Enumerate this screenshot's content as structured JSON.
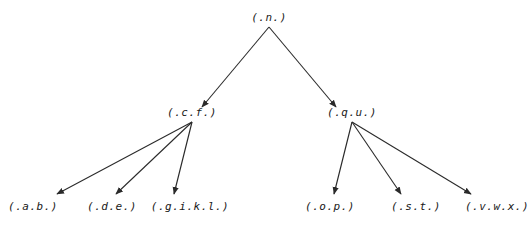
{
  "diagram": {
    "type": "tree",
    "root": {
      "label": "(.n.)",
      "x": 269,
      "y": 18,
      "children": [
        "cf",
        "qu"
      ]
    },
    "nodes": {
      "n": {
        "label": "(.n.)",
        "x": 269,
        "y": 18
      },
      "cf": {
        "label": "(.c.f.)",
        "x": 192,
        "y": 113
      },
      "qu": {
        "label": "(.q.u.)",
        "x": 352,
        "y": 113
      },
      "ab": {
        "label": "(.a.b.)",
        "x": 33,
        "y": 207
      },
      "de": {
        "label": "(.d.e.)",
        "x": 112,
        "y": 207
      },
      "gikl": {
        "label": "(.g.i.k.l.)",
        "x": 190,
        "y": 207
      },
      "op": {
        "label": "(.o.p.)",
        "x": 330,
        "y": 207
      },
      "st": {
        "label": "(.s.t.)",
        "x": 416,
        "y": 207
      },
      "vwx": {
        "label": "(.v.w.x.)",
        "x": 497,
        "y": 207
      }
    },
    "edges": [
      {
        "from": "n",
        "to": "cf",
        "x1": 269,
        "y1": 27,
        "x2": 202,
        "y2": 107
      },
      {
        "from": "n",
        "to": "qu",
        "x1": 269,
        "y1": 27,
        "x2": 336,
        "y2": 107
      },
      {
        "from": "cf",
        "to": "ab",
        "x1": 192,
        "y1": 122,
        "x2": 57,
        "y2": 194
      },
      {
        "from": "cf",
        "to": "de",
        "x1": 192,
        "y1": 122,
        "x2": 116,
        "y2": 194
      },
      {
        "from": "cf",
        "to": "gikl",
        "x1": 192,
        "y1": 122,
        "x2": 174,
        "y2": 194
      },
      {
        "from": "qu",
        "to": "op",
        "x1": 352,
        "y1": 122,
        "x2": 334,
        "y2": 194
      },
      {
        "from": "qu",
        "to": "st",
        "x1": 352,
        "y1": 122,
        "x2": 401,
        "y2": 194
      },
      {
        "from": "qu",
        "to": "vwx",
        "x1": 352,
        "y1": 122,
        "x2": 471,
        "y2": 194
      }
    ]
  }
}
